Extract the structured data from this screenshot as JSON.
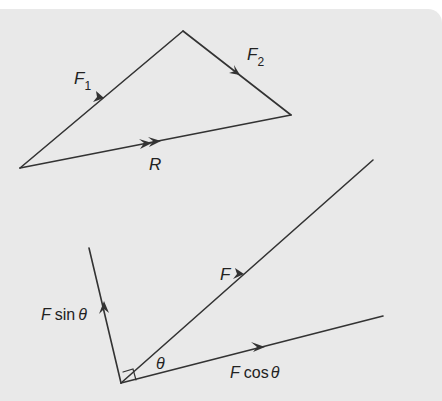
{
  "figure1": {
    "title": "Vector triangle",
    "labels": {
      "f1": "F",
      "f1_sub": "1",
      "f2": "F",
      "f2_sub": "2",
      "r": "R"
    }
  },
  "figure2": {
    "title": "Resolution of a force into components",
    "labels": {
      "f": "F",
      "theta": "θ",
      "f_sin_prefix": "F",
      "f_sin": "sin",
      "f_sin_theta": "θ",
      "f_cos_prefix": "F",
      "f_cos": "cos",
      "f_cos_theta": "θ"
    }
  },
  "colors": {
    "background": "#e9e9e9",
    "line": "#333333",
    "text": "#222222"
  }
}
